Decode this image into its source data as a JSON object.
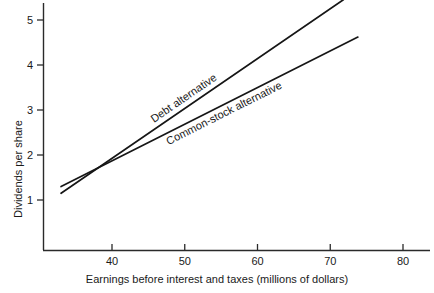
{
  "chart_data": {
    "type": "line",
    "title": "",
    "xlabel": "Earnings before interest and taxes (millions of dollars)",
    "ylabel": "Dividends per share",
    "xlim": [
      33,
      85
    ],
    "ylim": [
      0,
      5.6
    ],
    "grid": false,
    "legend_position": "inline-on-line",
    "xticks": [
      40,
      50,
      60,
      70,
      80
    ],
    "xtick_labels": [
      "40",
      "50",
      "60",
      "70",
      "80"
    ],
    "yticks": [
      1,
      2,
      3,
      4,
      5
    ],
    "ytick_labels": [
      "1",
      "2",
      "3",
      "4",
      "5"
    ],
    "series": [
      {
        "name": "Debt alternative",
        "label": "Debt alternative",
        "x": [
          33.0,
          71.8
        ],
        "y": [
          1.15,
          5.45
        ],
        "label_x": 45.5,
        "label_y": 2.78
      },
      {
        "name": "Common-stock alternative",
        "label": "Common-stock alternative",
        "x": [
          33.0,
          73.8
        ],
        "y": [
          1.3,
          4.62
        ],
        "label_x": 47.5,
        "label_y": 2.3
      }
    ]
  },
  "axis": {
    "y_title": "Dividends per share",
    "x_title": "Earnings before interest and taxes (millions of dollars)"
  }
}
